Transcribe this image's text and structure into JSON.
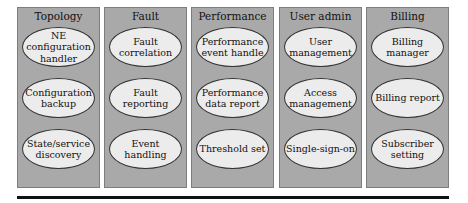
{
  "columns": [
    {
      "title": "Topology",
      "items": [
        "NE configuration handler",
        "Configuration backup",
        "State/service discovery"
      ]
    },
    {
      "title": "Fault",
      "items": [
        "Fault correlation",
        "Fault reporting",
        "Event handling"
      ]
    },
    {
      "title": "Performance",
      "items": [
        "Performance event handle",
        "Performance data report",
        "Threshold set"
      ]
    },
    {
      "title": "User admin",
      "items": [
        "User management",
        "Access management",
        "Single-sign-on"
      ]
    },
    {
      "title": "Billing",
      "items": [
        "Billing manager",
        "Billing report",
        "Subscriber setting"
      ]
    }
  ]
}
